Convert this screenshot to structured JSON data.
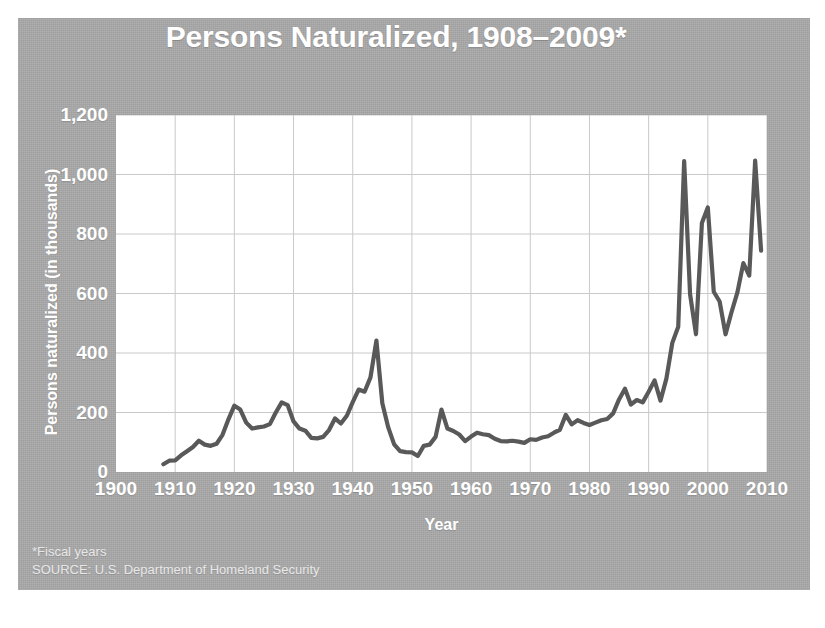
{
  "chart_data": {
    "type": "line",
    "title": "Persons Naturalized, 1908–2009*",
    "xlabel": "Year",
    "ylabel": "Persons naturalized (in thousands)",
    "xlim": [
      1900,
      2010
    ],
    "ylim": [
      0,
      1200
    ],
    "xticks": [
      1900,
      1910,
      1920,
      1930,
      1940,
      1950,
      1960,
      1970,
      1980,
      1990,
      2000,
      2010
    ],
    "xtick_labels": [
      "1900",
      "1910",
      "1920",
      "1930",
      "1940",
      "1950",
      "1960",
      "1970",
      "1980",
      "1990",
      "2000",
      "2010"
    ],
    "yticks": [
      0,
      200,
      400,
      600,
      800,
      1000,
      1200
    ],
    "ytick_labels": [
      "0",
      "200",
      "400",
      "600",
      "800",
      "1,000",
      "1,200"
    ],
    "grid": true,
    "legend": "none",
    "line_color": "#595959",
    "plot_background": "#ffffff",
    "panel_background": "#a8a8a8",
    "text_color": "#ffffff",
    "series": [
      {
        "name": "Persons naturalized",
        "x": [
          1908,
          1909,
          1910,
          1911,
          1912,
          1913,
          1914,
          1915,
          1916,
          1917,
          1918,
          1919,
          1920,
          1921,
          1922,
          1923,
          1924,
          1925,
          1926,
          1927,
          1928,
          1929,
          1930,
          1931,
          1932,
          1933,
          1934,
          1935,
          1936,
          1937,
          1938,
          1939,
          1940,
          1941,
          1942,
          1943,
          1944,
          1945,
          1946,
          1947,
          1948,
          1949,
          1950,
          1951,
          1952,
          1953,
          1954,
          1955,
          1956,
          1957,
          1958,
          1959,
          1960,
          1961,
          1962,
          1963,
          1964,
          1965,
          1966,
          1967,
          1968,
          1969,
          1970,
          1971,
          1972,
          1973,
          1974,
          1975,
          1976,
          1977,
          1978,
          1979,
          1980,
          1981,
          1982,
          1983,
          1984,
          1985,
          1986,
          1987,
          1988,
          1989,
          1990,
          1991,
          1992,
          1993,
          1994,
          1995,
          1996,
          1997,
          1998,
          1999,
          2000,
          2001,
          2002,
          2003,
          2004,
          2005,
          2006,
          2007,
          2008,
          2009
        ],
        "values": [
          26,
          38,
          39,
          56,
          70,
          84,
          105,
          92,
          88,
          95,
          125,
          177,
          223,
          210,
          166,
          146,
          150,
          153,
          161,
          200,
          234,
          225,
          170,
          146,
          139,
          115,
          113,
          118,
          141,
          180,
          163,
          189,
          235,
          277,
          270,
          318,
          442,
          231,
          150,
          93,
          70,
          67,
          66,
          54,
          88,
          92,
          118,
          210,
          146,
          138,
          126,
          104,
          119,
          132,
          127,
          124,
          112,
          104,
          103,
          105,
          102,
          98,
          110,
          108,
          116,
          120,
          132,
          142,
          192,
          160,
          174,
          165,
          158,
          166,
          174,
          178,
          197,
          244,
          280,
          227,
          242,
          234,
          270,
          308,
          240,
          314,
          434,
          488,
          1045,
          598,
          463,
          837,
          889,
          606,
          573,
          463,
          537,
          604,
          702,
          660,
          1047,
          744
        ],
        "notable_points": [
          {
            "year": 1919,
            "value": 177,
            "note": "post-WWI rise"
          },
          {
            "year": 1920,
            "value": 223,
            "note": "early peak"
          },
          {
            "year": 1928,
            "value": 234,
            "note": "1920s peak"
          },
          {
            "year": 1944,
            "value": 442,
            "note": "WWII peak"
          },
          {
            "year": 1950,
            "value": 66,
            "note": "postwar trough"
          },
          {
            "year": 1955,
            "value": 210,
            "note": "mid-1950s peak"
          },
          {
            "year": 1996,
            "value": 1045,
            "note": "record spike"
          },
          {
            "year": 1997,
            "value": 598,
            "note": "sharp drop"
          },
          {
            "year": 2000,
            "value": 889,
            "note": "secondary peak"
          },
          {
            "year": 2003,
            "value": 463,
            "note": "trough"
          },
          {
            "year": 2008,
            "value": 1047,
            "note": "highest point"
          },
          {
            "year": 2009,
            "value": 744,
            "note": "final year"
          }
        ]
      }
    ],
    "footnotes": [
      "*Fiscal years",
      "SOURCE: U.S. Department of Homeland Security"
    ]
  }
}
